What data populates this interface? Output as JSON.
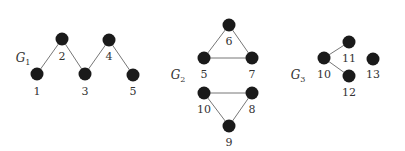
{
  "diagram": {
    "colors": {
      "node": "#1a1a1a",
      "edge": "#777777",
      "text": "#333333",
      "background": "#ffffff"
    },
    "graphs": [
      {
        "id": "G1",
        "label": "G",
        "subscript": "1",
        "label_pos": [
          23,
          62
        ],
        "nodes": [
          {
            "id": "n1",
            "label": "1",
            "x": 37,
            "y": 74,
            "lx": 37,
            "ly": 95
          },
          {
            "id": "n2",
            "label": "2",
            "x": 62,
            "y": 39,
            "lx": 62,
            "ly": 60
          },
          {
            "id": "n3",
            "label": "3",
            "x": 85,
            "y": 74,
            "lx": 85,
            "ly": 95
          },
          {
            "id": "n4",
            "label": "4",
            "x": 109,
            "y": 40,
            "lx": 109,
            "ly": 60
          },
          {
            "id": "n5",
            "label": "5",
            "x": 133,
            "y": 75,
            "lx": 133,
            "ly": 95
          }
        ],
        "edges": [
          [
            "n1",
            "n2"
          ],
          [
            "n2",
            "n3"
          ],
          [
            "n3",
            "n4"
          ],
          [
            "n4",
            "n5"
          ]
        ]
      },
      {
        "id": "G2",
        "label": "G",
        "subscript": "2",
        "label_pos": [
          178,
          79
        ],
        "nodes": [
          {
            "id": "n6",
            "label": "6",
            "x": 229,
            "y": 25,
            "lx": 229,
            "ly": 45
          },
          {
            "id": "n5b",
            "label": "5",
            "x": 204,
            "y": 58,
            "lx": 204,
            "ly": 78
          },
          {
            "id": "n7",
            "label": "7",
            "x": 252,
            "y": 58,
            "lx": 252,
            "ly": 78
          },
          {
            "id": "n10b",
            "label": "10",
            "x": 204,
            "y": 93,
            "lx": 204,
            "ly": 113
          },
          {
            "id": "n8",
            "label": "8",
            "x": 252,
            "y": 93,
            "lx": 252,
            "ly": 113
          },
          {
            "id": "n9",
            "label": "9",
            "x": 229,
            "y": 126,
            "lx": 229,
            "ly": 146
          }
        ],
        "edges": [
          [
            "n6",
            "n5b"
          ],
          [
            "n6",
            "n7"
          ],
          [
            "n5b",
            "n7"
          ],
          [
            "n10b",
            "n8"
          ],
          [
            "n10b",
            "n9"
          ],
          [
            "n8",
            "n9"
          ]
        ]
      },
      {
        "id": "G3",
        "label": "G",
        "subscript": "3",
        "label_pos": [
          298,
          79
        ],
        "nodes": [
          {
            "id": "n10",
            "label": "10",
            "x": 324,
            "y": 58,
            "lx": 324,
            "ly": 78
          },
          {
            "id": "n11",
            "label": "11",
            "x": 349,
            "y": 42,
            "lx": 349,
            "ly": 62
          },
          {
            "id": "n12",
            "label": "12",
            "x": 349,
            "y": 76,
            "lx": 349,
            "ly": 96
          },
          {
            "id": "n13",
            "label": "13",
            "x": 373,
            "y": 59,
            "lx": 373,
            "ly": 78
          }
        ],
        "edges": [
          [
            "n10",
            "n11"
          ],
          [
            "n10",
            "n12"
          ]
        ]
      }
    ]
  }
}
